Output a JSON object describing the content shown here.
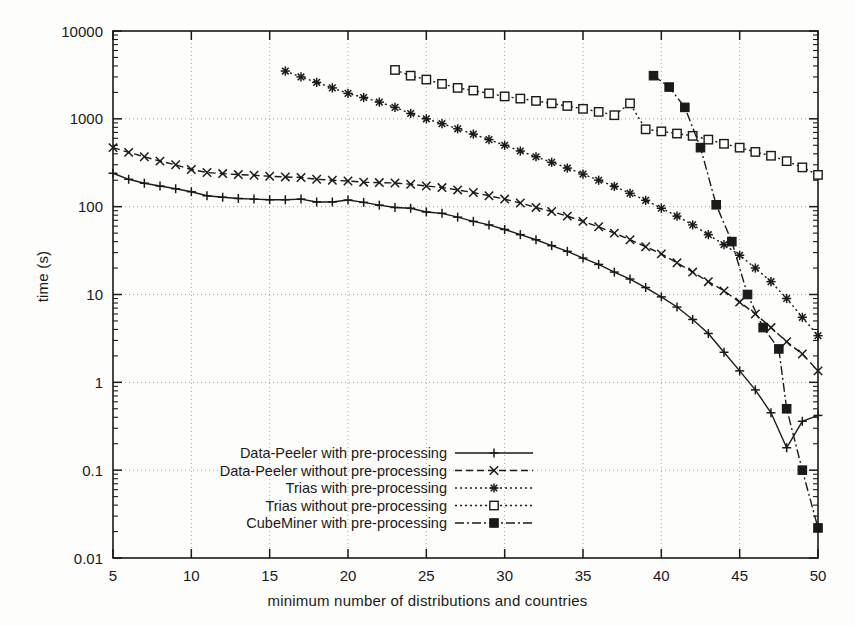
{
  "chart_data": {
    "type": "line",
    "title": "",
    "xlabel": "minimum number of distributions and countries",
    "ylabel": "time (s)",
    "xlim": [
      5,
      50
    ],
    "ylim": [
      0.01,
      10000
    ],
    "yscale": "log",
    "xscale": "linear",
    "grid": true,
    "xticks": [
      5,
      10,
      15,
      20,
      25,
      30,
      35,
      40,
      45,
      50
    ],
    "xtick_labels": [
      "5",
      "10",
      "15",
      "20",
      "25",
      "30",
      "35",
      "40",
      "45",
      "50"
    ],
    "yticks": [
      0.01,
      0.1,
      1,
      10,
      100,
      1000,
      10000
    ],
    "ytick_labels": [
      "0.01",
      "0.1",
      "1",
      "10",
      "100",
      "1000",
      "10000"
    ],
    "legend_position": "lower-center-left",
    "series": [
      {
        "name": "Data-Peeler with pre-processing",
        "marker": "plus",
        "dash": "solid",
        "color": "#1a1a1a",
        "x": [
          5,
          6,
          7,
          8,
          9,
          10,
          11,
          12,
          13,
          14,
          15,
          16,
          17,
          18,
          19,
          20,
          21,
          22,
          23,
          24,
          25,
          26,
          27,
          28,
          29,
          30,
          31,
          32,
          33,
          34,
          35,
          36,
          37,
          38,
          39,
          40,
          41,
          42,
          43,
          44,
          45,
          46,
          47,
          48,
          49,
          50
        ],
        "y": [
          240,
          205,
          185,
          172,
          160,
          148,
          133,
          128,
          124,
          122,
          120,
          120,
          122,
          113,
          113,
          119,
          112,
          104,
          98,
          96,
          87,
          84,
          76,
          68,
          62,
          55,
          48,
          42,
          36,
          31,
          26,
          22,
          18,
          15,
          12,
          9.4,
          7.2,
          5.2,
          3.6,
          2.2,
          1.35,
          0.82,
          0.45,
          0.18,
          0.36,
          0.42
        ]
      },
      {
        "name": "Data-Peeler without pre-processing",
        "marker": "x",
        "dash": "dashed",
        "color": "#1a1a1a",
        "x": [
          5,
          6,
          7,
          8,
          9,
          10,
          11,
          12,
          13,
          14,
          15,
          16,
          17,
          18,
          19,
          20,
          21,
          22,
          23,
          24,
          25,
          26,
          27,
          28,
          29,
          30,
          31,
          32,
          33,
          34,
          35,
          36,
          37,
          38,
          39,
          40,
          41,
          42,
          43,
          44,
          45,
          46,
          47,
          48,
          49,
          50
        ],
        "y": [
          470,
          415,
          370,
          330,
          300,
          265,
          245,
          238,
          232,
          228,
          222,
          218,
          215,
          205,
          200,
          196,
          190,
          188,
          186,
          180,
          172,
          165,
          155,
          145,
          133,
          122,
          110,
          98,
          88,
          78,
          68,
          59,
          50,
          42,
          35,
          29,
          23,
          18,
          14,
          11,
          8.2,
          6.0,
          4.2,
          2.9,
          2.1,
          1.35
        ]
      },
      {
        "name": "Trias with pre-processing",
        "marker": "asterisk",
        "dash": "dotted",
        "color": "#1a1a1a",
        "x": [
          16,
          17,
          18,
          19,
          20,
          21,
          22,
          23,
          24,
          25,
          26,
          27,
          28,
          29,
          30,
          31,
          32,
          33,
          34,
          35,
          36,
          37,
          38,
          39,
          40,
          41,
          42,
          43,
          44,
          45,
          46,
          47,
          48,
          49,
          50
        ],
        "y": [
          3500,
          3000,
          2600,
          2250,
          1950,
          1750,
          1550,
          1350,
          1150,
          1000,
          880,
          770,
          670,
          580,
          500,
          430,
          370,
          320,
          275,
          235,
          200,
          170,
          142,
          118,
          96,
          78,
          62,
          48,
          37,
          28,
          20,
          14,
          9.0,
          5.5,
          3.4
        ]
      },
      {
        "name": "Trias without pre-processing",
        "marker": "square-open",
        "dash": "dotted",
        "color": "#1a1a1a",
        "x": [
          23,
          24,
          25,
          26,
          27,
          28,
          29,
          30,
          31,
          32,
          33,
          34,
          35,
          36,
          37,
          38,
          39,
          40,
          41,
          42,
          43,
          44,
          45,
          46,
          47,
          48,
          49,
          50
        ],
        "y": [
          3600,
          3100,
          2800,
          2500,
          2250,
          2100,
          1950,
          1800,
          1700,
          1600,
          1500,
          1400,
          1300,
          1200,
          1100,
          1500,
          760,
          720,
          680,
          640,
          580,
          520,
          470,
          420,
          380,
          330,
          280,
          230
        ]
      },
      {
        "name": "CubeMiner with pre-processing",
        "marker": "square-filled",
        "dash": "dashdot",
        "color": "#1a1a1a",
        "x": [
          39.5,
          40.5,
          41.5,
          42.5,
          43.5,
          44.5,
          45.5,
          46.5,
          47.5,
          48,
          49,
          50
        ],
        "y": [
          3100,
          2300,
          1350,
          470,
          105,
          40,
          10,
          4.2,
          2.4,
          0.5,
          0.1,
          0.022
        ]
      }
    ]
  },
  "legend": {
    "entries": [
      {
        "label": "Data-Peeler with pre-processing"
      },
      {
        "label": "Data-Peeler without pre-processing"
      },
      {
        "label": "Trias with pre-processing"
      },
      {
        "label": "Trias without pre-processing"
      },
      {
        "label": "CubeMiner with pre-processing"
      }
    ]
  },
  "axes": {
    "x_title": "minimum number of distributions and countries",
    "y_title": "time (s)"
  }
}
